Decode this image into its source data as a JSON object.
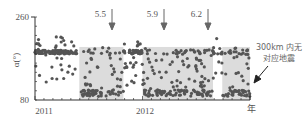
{
  "chart_data": {
    "type": "scatter",
    "title": "",
    "xlabel": "年",
    "ylabel": "α(°)",
    "ylim": [
      80,
      260
    ],
    "yticks": [
      80,
      260
    ],
    "xticks": [
      "2011",
      "2012"
    ],
    "grid": false,
    "legend": null,
    "shaded_regions": [
      {
        "x_start_frac": 0.206,
        "x_end_frac": 0.411,
        "y_top": 195,
        "y_bottom": 80
      },
      {
        "x_start_frac": 0.5,
        "x_end_frac": 0.828,
        "y_top": 195,
        "y_bottom": 80
      },
      {
        "x_start_frac": 0.871,
        "x_end_frac": 1.0,
        "y_top": 195,
        "y_bottom": 80
      }
    ],
    "earthquake_markers": [
      {
        "label": "5.5",
        "x_frac": 0.368
      },
      {
        "label": "5.9",
        "x_frac": 0.617
      },
      {
        "label": "6.2",
        "x_frac": 0.828
      }
    ],
    "annotation": {
      "line1": "300km 内无",
      "line2": "对应地震"
    },
    "series": [
      {
        "name": "α",
        "description": "Dense baseline near ~184° outside shaded intervals; inside shaded intervals values scatter down to ~90-100° with clusters near bottom",
        "baseline": 184,
        "low_cluster": 95
      }
    ]
  },
  "labels": {
    "y_top": "260",
    "y_bottom": "80",
    "ylabel": "α(°)",
    "x_2011": "2011",
    "x_2012": "2012",
    "x_unit": "年",
    "m1": "5.5",
    "m2": "5.9",
    "m3": "6.2",
    "ann1": "300km 内无",
    "ann2": "对应地震"
  },
  "colors": {
    "axis": "#333333",
    "point": "#555555",
    "shade": "#dcdcdc",
    "arrow": "#666666"
  }
}
